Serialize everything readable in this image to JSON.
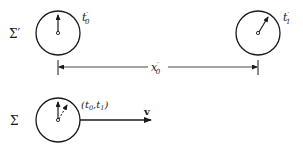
{
  "diagram": {
    "frames": [
      {
        "name": "Σ′",
        "label": "Σ′",
        "clocks": [
          {
            "id": "clock-origin",
            "label": "t",
            "sub": "0",
            "prime": "′",
            "hand": "up"
          },
          {
            "id": "clock-remote",
            "label": "t",
            "sub": "1",
            "prime": "′",
            "hand": "up-right"
          }
        ],
        "separation": {
          "label": "x",
          "sub": "0",
          "prime": "′"
        }
      },
      {
        "name": "Σ",
        "label": "Σ",
        "clocks": [
          {
            "id": "clock-moving",
            "label": "(t",
            "sub0": "0",
            "comma": ",t",
            "sub1": "1",
            "close": ")",
            "hands": [
              "up",
              "up-right-dashed"
            ]
          }
        ],
        "velocity": {
          "label": "v"
        }
      }
    ],
    "colors": {
      "ink": "#1a1a1a",
      "background": "#ffffff"
    }
  }
}
